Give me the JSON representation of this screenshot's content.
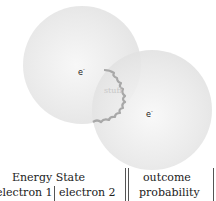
{
  "diagram": {
    "electron_labels": [
      "e",
      "e"
    ],
    "electron_charge": "-",
    "center_label": "stuff",
    "colors": {
      "sphere": "#e6e6e6",
      "wavy_line": "#a8a8a8",
      "stuff_text": "#c8c8c8"
    }
  },
  "table": {
    "group_header": "Energy State",
    "columns": [
      "electron 1",
      "electron 2"
    ],
    "outcome_header": "outcome",
    "probability_header": "probability"
  }
}
